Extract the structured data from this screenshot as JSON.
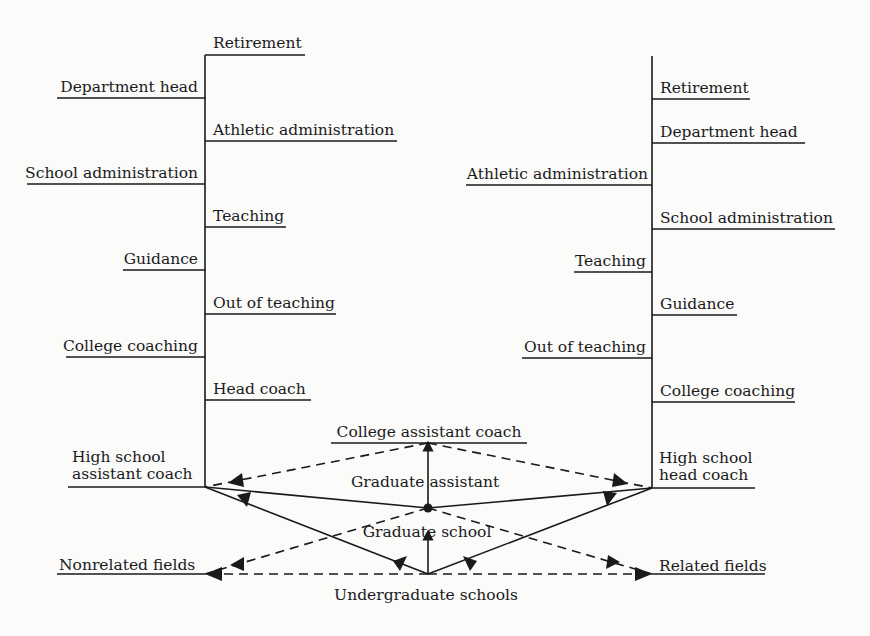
{
  "diagram": {
    "type": "career-path-flowchart",
    "colors": {
      "line": "#1a1a1a",
      "background": "#fbfbfa"
    },
    "left_tree": {
      "root": "High school assistant coach",
      "root_lines": [
        "High school",
        "assistant coach"
      ],
      "branches": [
        {
          "label": "Retirement",
          "side": "right"
        },
        {
          "label": "Department head",
          "side": "left"
        },
        {
          "label": "Athletic administration",
          "side": "right"
        },
        {
          "label": "School administration",
          "side": "left"
        },
        {
          "label": "Teaching",
          "side": "right"
        },
        {
          "label": "Guidance",
          "side": "left"
        },
        {
          "label": "Out of teaching",
          "side": "right"
        },
        {
          "label": "College coaching",
          "side": "left"
        },
        {
          "label": "Head coach",
          "side": "right"
        }
      ]
    },
    "right_tree": {
      "root": "High school head coach",
      "root_lines": [
        "High school",
        "head coach"
      ],
      "branches": [
        {
          "label": "Retirement",
          "side": "right"
        },
        {
          "label": "Department head",
          "side": "right"
        },
        {
          "label": "Athletic administration",
          "side": "left"
        },
        {
          "label": "School administration",
          "side": "right"
        },
        {
          "label": "Teaching",
          "side": "left"
        },
        {
          "label": "Guidance",
          "side": "right"
        },
        {
          "label": "Out of teaching",
          "side": "left"
        },
        {
          "label": "College coaching",
          "side": "right"
        }
      ]
    },
    "center": {
      "college_assistant_coach": "College assistant coach",
      "graduate_assistant": "Graduate assistant",
      "graduate_school": "Graduate school",
      "undergraduate_schools": "Undergraduate schools",
      "nonrelated_fields": "Nonrelated fields",
      "related_fields": "Related fields"
    },
    "edges": [
      {
        "from": "Undergraduate schools",
        "to": "Graduate school",
        "style": "solid"
      },
      {
        "from": "Graduate school",
        "to": "College assistant coach",
        "via": "Graduate assistant",
        "style": "solid"
      },
      {
        "from": "Undergraduate schools",
        "to": "High school assistant coach",
        "style": "solid"
      },
      {
        "from": "Undergraduate schools",
        "to": "High school head coach",
        "style": "solid"
      },
      {
        "from": "Graduate school",
        "to": "High school assistant coach",
        "style": "solid"
      },
      {
        "from": "Graduate school",
        "to": "High school head coach",
        "style": "solid"
      },
      {
        "from": "College assistant coach",
        "to": "High school assistant coach",
        "style": "dashed"
      },
      {
        "from": "College assistant coach",
        "to": "High school head coach",
        "style": "dashed"
      },
      {
        "from": "Graduate school",
        "to": "Nonrelated fields",
        "style": "dashed"
      },
      {
        "from": "Graduate school",
        "to": "Related fields",
        "style": "dashed"
      },
      {
        "from": "Undergraduate schools",
        "to": "Nonrelated fields",
        "style": "dashed"
      },
      {
        "from": "Undergraduate schools",
        "to": "Related fields",
        "style": "dashed"
      }
    ]
  }
}
